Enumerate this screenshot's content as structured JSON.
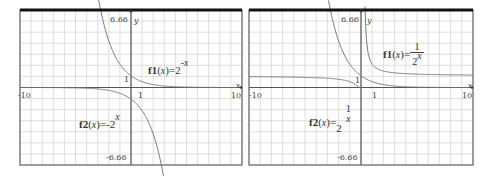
{
  "chart_data": [
    {
      "type": "line",
      "title": "",
      "xlabel": "x",
      "ylabel": "y",
      "xlim": [
        -10,
        10
      ],
      "ylim": [
        -6.66,
        6.66
      ],
      "grid": true,
      "tick_labels": {
        "xmin": "-10",
        "xmax": "10",
        "x1": "1",
        "ymax": "6.66",
        "ymin": "-6.66",
        "y1": "1"
      },
      "series": [
        {
          "name": "f1(x)=2^-x",
          "expr": "2^(-x)",
          "label_name": "f1",
          "label_rhs": "2",
          "label_exp": "-x"
        },
        {
          "name": "f2(x)=-2^x",
          "expr": "-(2^x)",
          "label_name": "f2",
          "label_rhs": "-2",
          "label_exp": "x"
        }
      ]
    },
    {
      "type": "line",
      "title": "",
      "xlabel": "x",
      "ylabel": "y",
      "xlim": [
        -10,
        10
      ],
      "ylim": [
        -6.66,
        6.66
      ],
      "grid": true,
      "tick_labels": {
        "xmin": "-10",
        "xmax": "10",
        "x1": "1",
        "ymax": "6.66",
        "ymin": "-6.66",
        "y1": "1"
      },
      "series": [
        {
          "name": "f1(x)=1/2^x",
          "expr": "1/(2^x)",
          "label_name": "f1",
          "label_num": "1",
          "label_den": "2",
          "label_den_exp": "x"
        },
        {
          "name": "f2(x)=2^(1/x)",
          "expr": "2^(1/x)",
          "label_name": "f2",
          "label_rhs": "2",
          "label_exp_num": "1",
          "label_exp_den": "x"
        }
      ]
    }
  ],
  "labels": {
    "var": "x",
    "open": "(",
    "close": ")",
    "eq": "="
  }
}
